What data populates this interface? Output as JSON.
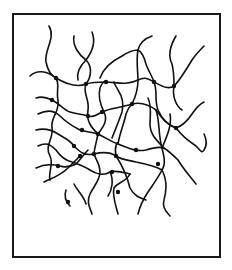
{
  "diagram": {
    "frame": {
      "x": 13,
      "y": 14,
      "width": 207,
      "height": 243
    },
    "colors": {
      "background": "#ffffff",
      "line": "#111111",
      "frame": "#1a1a1a"
    },
    "crosslink_count": 22
  }
}
